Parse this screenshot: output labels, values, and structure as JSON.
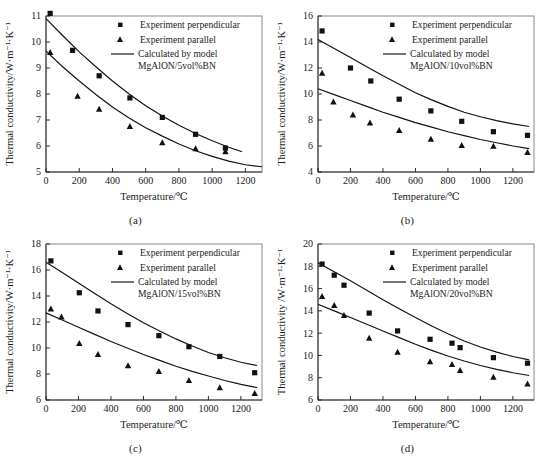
{
  "figure": {
    "panel_count": 4
  },
  "common": {
    "xlabel": "Temperature/℃",
    "ylabel": "Thermal conductivity/W·m⁻¹·K⁻¹",
    "legend": {
      "perpendicular": "Experiment perpendicular",
      "parallel": "Experiment parallel",
      "model_line1": "Calculated by model"
    },
    "colors": {
      "marker": "#111111",
      "curve": "#111111",
      "axis": "#2b2b2b",
      "frame": "#7d7d7d",
      "background": "#ffffff"
    }
  },
  "chart_data": [
    {
      "type": "scatter",
      "panel": "a",
      "caption": "(a)",
      "title": "MgAlON/5vol%BN",
      "model_label": "MgAlON/5vol%BN",
      "xlabel": "Temperature/℃",
      "ylabel": "Thermal conductivity/W·m⁻¹·K⁻¹",
      "xlim": [
        0,
        1300
      ],
      "ylim": [
        5,
        11
      ],
      "xticks": [
        0,
        200,
        400,
        600,
        800,
        1000,
        1200
      ],
      "yticks": [
        5,
        6,
        7,
        8,
        9,
        10,
        11
      ],
      "grid": false,
      "legend_position": "top-right",
      "series": [
        {
          "name": "Experiment perpendicular",
          "marker": "square",
          "x": [
            25,
            160,
            320,
            505,
            700,
            900,
            1080
          ],
          "y": [
            11.1,
            9.68,
            8.7,
            7.85,
            7.1,
            6.45,
            5.92
          ]
        },
        {
          "name": "Experiment parallel",
          "marker": "triangle",
          "x": [
            25,
            190,
            320,
            505,
            700,
            900,
            1080
          ],
          "y": [
            9.6,
            7.92,
            7.42,
            6.75,
            6.13,
            5.9,
            5.78
          ]
        },
        {
          "name": "Calculated by model (perpendicular)",
          "marker": "line",
          "x": [
            0,
            100,
            200,
            300,
            400,
            500,
            600,
            700,
            800,
            900,
            1000,
            1100,
            1180
          ],
          "y": [
            10.9,
            10.25,
            9.62,
            9.05,
            8.5,
            8.0,
            7.55,
            7.15,
            6.8,
            6.48,
            6.2,
            5.95,
            5.78
          ]
        },
        {
          "name": "Calculated by model (parallel)",
          "marker": "line",
          "x": [
            0,
            100,
            200,
            300,
            400,
            500,
            600,
            700,
            800,
            900,
            1000,
            1100,
            1200,
            1300
          ],
          "y": [
            9.65,
            9.05,
            8.5,
            7.98,
            7.5,
            7.08,
            6.7,
            6.38,
            6.08,
            5.82,
            5.6,
            5.42,
            5.28,
            5.2
          ]
        }
      ]
    },
    {
      "type": "scatter",
      "panel": "b",
      "caption": "(b)",
      "title": "MgAlON/10vol%BN",
      "model_label": "MgAlON/10vol%BN",
      "xlabel": "Temperature/℃",
      "ylabel": "Thermal conductivity/W·m⁻¹·K⁻¹",
      "xlim": [
        0,
        1330
      ],
      "ylim": [
        4,
        16
      ],
      "xticks": [
        0,
        200,
        400,
        600,
        800,
        1000,
        1200
      ],
      "yticks": [
        4,
        6,
        8,
        10,
        12,
        14,
        16
      ],
      "grid": false,
      "legend_position": "top-right",
      "series": [
        {
          "name": "Experiment perpendicular",
          "marker": "square",
          "x": [
            25,
            200,
            325,
            500,
            695,
            885,
            1080,
            1290
          ],
          "y": [
            14.85,
            12.0,
            11.0,
            9.6,
            8.7,
            7.9,
            7.1,
            6.82
          ]
        },
        {
          "name": "Experiment parallel",
          "marker": "triangle",
          "x": [
            25,
            95,
            215,
            320,
            500,
            695,
            885,
            1080,
            1290
          ],
          "y": [
            11.6,
            9.4,
            8.4,
            7.78,
            7.2,
            6.52,
            6.05,
            5.98,
            5.5
          ]
        },
        {
          "name": "Calculated by model (perpendicular)",
          "marker": "line",
          "x": [
            0,
            100,
            200,
            300,
            400,
            500,
            600,
            700,
            800,
            900,
            1000,
            1100,
            1200,
            1300
          ],
          "y": [
            14.2,
            13.5,
            12.8,
            12.1,
            11.4,
            10.75,
            10.1,
            9.55,
            9.05,
            8.6,
            8.25,
            7.95,
            7.7,
            7.5
          ]
        },
        {
          "name": "Calculated by model (parallel)",
          "marker": "line",
          "x": [
            0,
            100,
            200,
            300,
            400,
            500,
            600,
            700,
            800,
            900,
            1000,
            1100,
            1200,
            1300
          ],
          "y": [
            10.4,
            9.95,
            9.5,
            9.05,
            8.6,
            8.2,
            7.8,
            7.45,
            7.1,
            6.8,
            6.5,
            6.25,
            6.0,
            5.8
          ]
        }
      ]
    },
    {
      "type": "scatter",
      "panel": "c",
      "caption": "(c)",
      "title": "MgAlON/15vol%BN",
      "model_label": "MgAlON/15vol%BN",
      "xlabel": "Temperature/℃",
      "ylabel": "Thermal conductivity/W·m⁻¹·K⁻¹",
      "xlim": [
        0,
        1330
      ],
      "ylim": [
        6,
        18
      ],
      "xticks": [
        0,
        200,
        400,
        600,
        800,
        1000,
        1200
      ],
      "yticks": [
        6,
        8,
        10,
        12,
        14,
        16,
        18
      ],
      "grid": false,
      "legend_position": "top-right",
      "series": [
        {
          "name": "Experiment perpendicular",
          "marker": "square",
          "x": [
            30,
            205,
            320,
            505,
            695,
            880,
            1070,
            1285
          ],
          "y": [
            16.7,
            14.25,
            12.85,
            11.8,
            10.95,
            10.1,
            9.35,
            8.1
          ]
        },
        {
          "name": "Experiment parallel",
          "marker": "triangle",
          "x": [
            30,
            95,
            205,
            320,
            505,
            695,
            880,
            1070,
            1285
          ],
          "y": [
            13.0,
            12.4,
            10.35,
            9.5,
            8.65,
            8.2,
            7.5,
            6.95,
            6.5
          ]
        },
        {
          "name": "Calculated by model (perpendicular)",
          "marker": "line",
          "x": [
            0,
            100,
            200,
            300,
            400,
            500,
            600,
            700,
            800,
            900,
            1000,
            1100,
            1200,
            1300
          ],
          "y": [
            16.6,
            15.8,
            15.0,
            14.2,
            13.4,
            12.65,
            11.95,
            11.3,
            10.7,
            10.15,
            9.65,
            9.25,
            8.9,
            8.65
          ]
        },
        {
          "name": "Calculated by model (parallel)",
          "marker": "line",
          "x": [
            0,
            100,
            200,
            300,
            400,
            500,
            600,
            700,
            800,
            900,
            1000,
            1100,
            1200,
            1300
          ],
          "y": [
            12.7,
            12.15,
            11.6,
            11.05,
            10.5,
            10.0,
            9.5,
            9.05,
            8.6,
            8.2,
            7.85,
            7.5,
            7.2,
            6.95
          ]
        }
      ]
    },
    {
      "type": "scatter",
      "panel": "d",
      "caption": "(d)",
      "title": "MgAlON/20vol%BN",
      "model_label": "MgAlON/20vol%BN",
      "xlabel": "Temperature/℃",
      "ylabel": "Thermal conductivity /W·m⁻¹·K⁻¹",
      "xlim": [
        0,
        1330
      ],
      "ylim": [
        6,
        20
      ],
      "xticks": [
        0,
        200,
        400,
        600,
        800,
        1000,
        1200
      ],
      "yticks": [
        6,
        8,
        10,
        12,
        14,
        16,
        18,
        20
      ],
      "grid": false,
      "legend_position": "top-right",
      "series": [
        {
          "name": "Experiment perpendicular",
          "marker": "square",
          "x": [
            25,
            100,
            160,
            315,
            490,
            690,
            825,
            875,
            1080,
            1290
          ],
          "y": [
            18.2,
            17.2,
            16.3,
            13.8,
            12.2,
            11.45,
            11.1,
            10.7,
            9.8,
            9.3
          ]
        },
        {
          "name": "Experiment parallel",
          "marker": "triangle",
          "x": [
            25,
            100,
            160,
            315,
            490,
            690,
            825,
            875,
            1080,
            1290
          ],
          "y": [
            15.3,
            14.5,
            13.6,
            11.55,
            10.3,
            9.45,
            9.2,
            8.65,
            8.05,
            7.45
          ]
        },
        {
          "name": "Calculated by model (perpendicular)",
          "marker": "line",
          "x": [
            0,
            100,
            200,
            300,
            400,
            500,
            600,
            700,
            800,
            900,
            1000,
            1100,
            1200,
            1300
          ],
          "y": [
            18.3,
            17.5,
            16.7,
            15.85,
            15.0,
            14.2,
            13.4,
            12.65,
            11.95,
            11.3,
            10.75,
            10.3,
            9.9,
            9.6
          ]
        },
        {
          "name": "Calculated by model (parallel)",
          "marker": "line",
          "x": [
            0,
            100,
            200,
            300,
            400,
            500,
            600,
            700,
            800,
            900,
            1000,
            1100,
            1200,
            1300
          ],
          "y": [
            14.6,
            14.0,
            13.4,
            12.8,
            12.2,
            11.6,
            11.0,
            10.45,
            9.95,
            9.5,
            9.1,
            8.75,
            8.45,
            8.2
          ]
        }
      ]
    }
  ]
}
